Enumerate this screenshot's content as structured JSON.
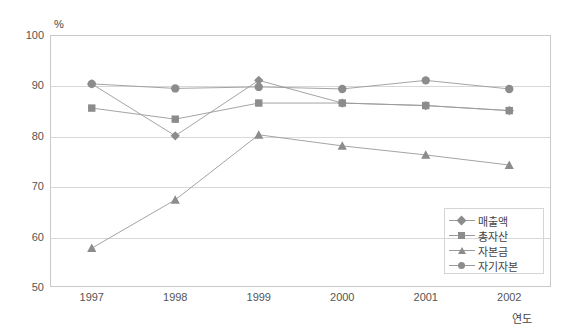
{
  "chart_data": {
    "type": "line",
    "title": "",
    "xlabel": "연도",
    "ylabel": "%",
    "unit_label": "%",
    "categories": [
      "1997",
      "1998",
      "1999",
      "2000",
      "2001",
      "2002"
    ],
    "ylim": [
      50,
      100
    ],
    "yticks": [
      50,
      60,
      70,
      80,
      90,
      100
    ],
    "grid": true,
    "legend_position": "inside-bottom-right",
    "series": [
      {
        "name": "매출액",
        "marker": "diamond",
        "color": "#8c8c8c",
        "values": [
          90.3,
          80.0,
          91.0,
          86.5,
          86.0,
          85.0
        ]
      },
      {
        "name": "총자산",
        "marker": "square",
        "color": "#8c8c8c",
        "values": [
          85.5,
          83.3,
          86.5,
          86.5,
          86.0,
          85.0
        ]
      },
      {
        "name": "자본금",
        "marker": "triangle",
        "color": "#8c8c8c",
        "values": [
          57.7,
          67.3,
          80.2,
          78.0,
          76.2,
          74.2
        ]
      },
      {
        "name": "자기자본",
        "marker": "circle",
        "color": "#8c8c8c",
        "values": [
          90.3,
          89.4,
          89.7,
          89.3,
          91.0,
          89.3
        ]
      }
    ]
  },
  "axis": {
    "y_tick_labels": [
      "100",
      "90",
      "80",
      "70",
      "60",
      "50"
    ],
    "x_tick_labels": [
      "1997",
      "1998",
      "1999",
      "2000",
      "2001",
      "2002"
    ],
    "x_title": "연도",
    "unit": "%"
  },
  "legend": {
    "items": [
      {
        "label": "매출액",
        "marker": "diamond"
      },
      {
        "label": "총자산",
        "marker": "square"
      },
      {
        "label": "자본금",
        "marker": "triangle"
      },
      {
        "label": "자기자본",
        "marker": "circle"
      }
    ]
  },
  "colors": {
    "line": "#9a9a9a",
    "marker": "#8c8c8c",
    "grid": "#d8d8d8",
    "frame": "#c9c9c9",
    "text": "#555555",
    "background": "#ffffff"
  }
}
